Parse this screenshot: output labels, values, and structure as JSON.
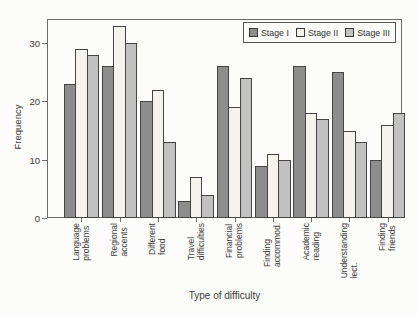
{
  "chart_data": {
    "type": "bar",
    "title": "",
    "xlabel": "Type of difficulty",
    "ylabel": "Frequency",
    "ylim": [
      0,
      34
    ],
    "yticks": [
      0,
      10,
      20,
      30
    ],
    "grid": false,
    "legend_position": "top-right-inside",
    "categories": [
      "Language\nproblems",
      "Regional\naccents",
      "Different\nfood",
      "Travel\ndifficulties",
      "Financial\nproblems",
      "Finding\naccommod.",
      "Academic\nreading",
      "Understanding\nlect.",
      "Finding\nfriends"
    ],
    "series": [
      {
        "name": "Stage I",
        "color": "#8d8d8d",
        "values": [
          23,
          26,
          20,
          3,
          26,
          9,
          26,
          25,
          10
        ]
      },
      {
        "name": "Stage II",
        "color": "#f4f3ee",
        "values": [
          29,
          33,
          22,
          7,
          19,
          11,
          18,
          15,
          16
        ]
      },
      {
        "name": "Stage III",
        "color": "#c1c1c1",
        "values": [
          28,
          30,
          13,
          4,
          24,
          10,
          17,
          13,
          18
        ]
      }
    ],
    "colors": {
      "bar_border": "#454545",
      "axis": "#6b6b6b",
      "text": "#3b3b3b",
      "background": "#fcfcfa"
    }
  }
}
